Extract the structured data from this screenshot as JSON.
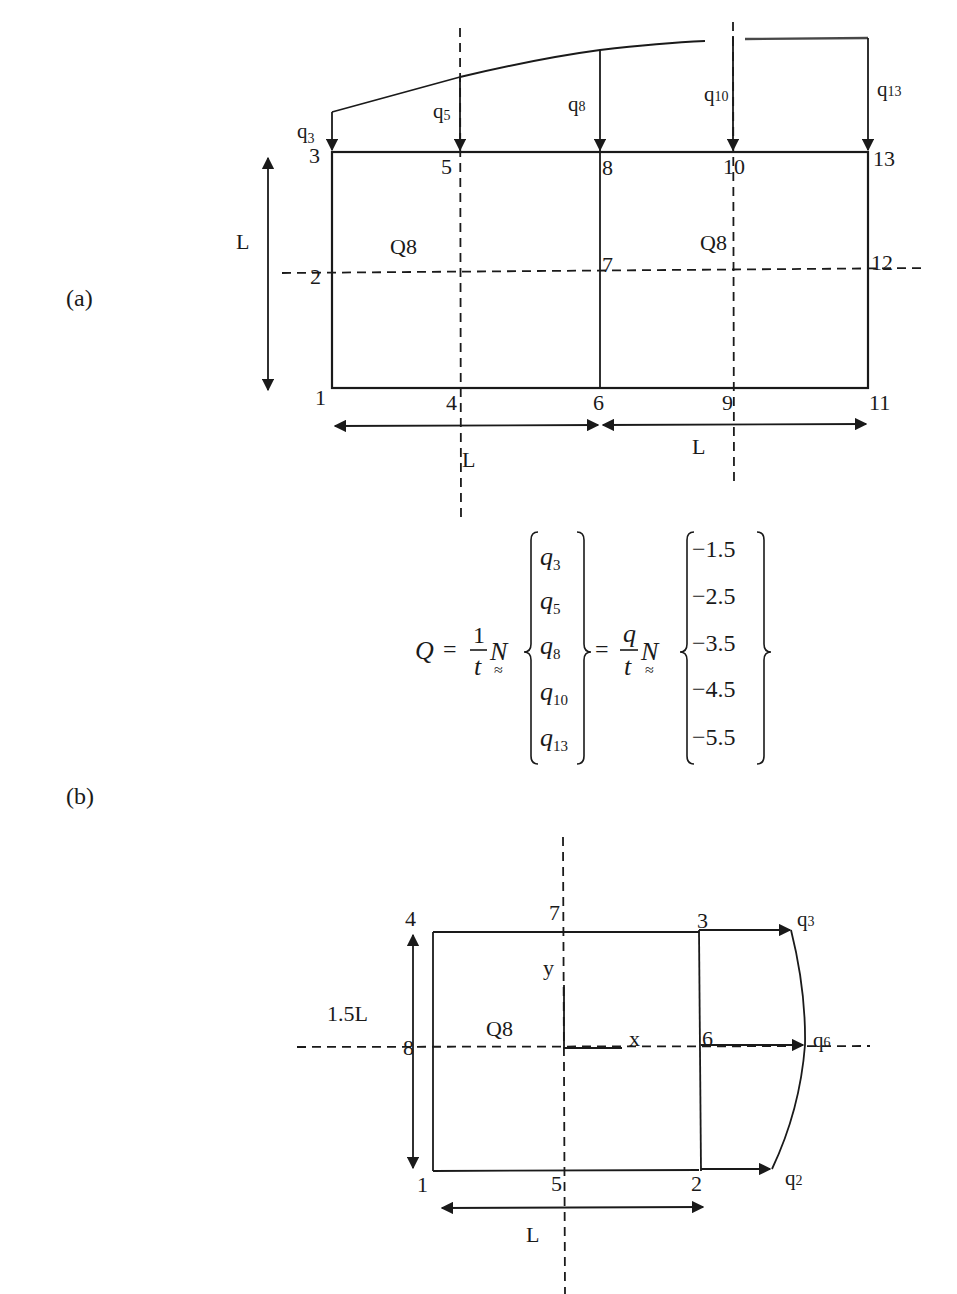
{
  "figure": {
    "part_a": {
      "label": "(a)",
      "element_labels": [
        "Q8",
        "Q8"
      ],
      "nodes": {
        "n1": "1",
        "n2": "2",
        "n3": "3",
        "n4": "4",
        "n5": "5",
        "n6": "6",
        "n7": "7",
        "n8": "8",
        "n9": "9",
        "n10": "10",
        "n11": "11",
        "n12": "12",
        "n13": "13"
      },
      "loads": [
        {
          "base": "q",
          "sub": "3"
        },
        {
          "base": "q",
          "sub": "5"
        },
        {
          "base": "q",
          "sub": "8"
        },
        {
          "base": "q",
          "sub": "10"
        },
        {
          "base": "q",
          "sub": "13"
        }
      ],
      "dimensions": {
        "height": "L",
        "width_left": "L",
        "width_right": "L"
      }
    },
    "equation": {
      "lhs": "Q",
      "equals": "=",
      "frac1_num": "1",
      "frac1_den": "t",
      "shape_fn": "N",
      "shape_fn_mark": "≈",
      "vector1": [
        {
          "base": "q",
          "sub": "3"
        },
        {
          "base": "q",
          "sub": "5"
        },
        {
          "base": "q",
          "sub": "8"
        },
        {
          "base": "q",
          "sub": "10"
        },
        {
          "base": "q",
          "sub": "13"
        }
      ],
      "frac2_num": "q",
      "frac2_den": "t",
      "vector2": [
        "−1.5",
        "−2.5",
        "−3.5",
        "−4.5",
        "−5.5"
      ]
    },
    "part_b": {
      "label": "(b)",
      "element_label": "Q8",
      "nodes": {
        "n1": "1",
        "n2": "2",
        "n3": "3",
        "n4": "4",
        "n5": "5",
        "n6": "6",
        "n7": "7",
        "n8": "8"
      },
      "loads": [
        {
          "base": "q",
          "sub": "3"
        },
        {
          "base": "q",
          "sub": "6"
        },
        {
          "base": "q",
          "sub": "2"
        }
      ],
      "axes": {
        "x": "x",
        "y": "y"
      },
      "dimensions": {
        "height": "1.5L",
        "width": "L"
      }
    }
  }
}
